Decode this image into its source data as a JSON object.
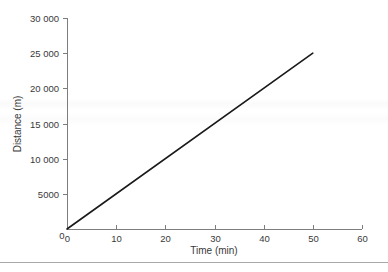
{
  "chart_data": {
    "type": "line",
    "title": "",
    "subtitle": "",
    "xlabel": "Time (min)",
    "ylabel": "Distance (m)",
    "xlim": [
      0,
      60
    ],
    "ylim": [
      0,
      30000
    ],
    "grid": false,
    "legend": null,
    "x_ticks": [
      0,
      10,
      20,
      30,
      40,
      50,
      60
    ],
    "x_tick_labels": [
      "0",
      "10",
      "20",
      "30",
      "40",
      "50",
      "60"
    ],
    "y_ticks": [
      0,
      5000,
      10000,
      15000,
      20000,
      25000,
      30000
    ],
    "y_tick_labels": [
      "0",
      "5000",
      "10 000",
      "15 000",
      "20 000",
      "25 000",
      "30 000"
    ],
    "origin_label": "0",
    "series": [
      {
        "name": "Distance",
        "color": "#1a1a1a",
        "x": [
          0,
          50
        ],
        "values": [
          0,
          25000
        ],
        "points": [
          {
            "x": 0,
            "y": 0
          },
          {
            "x": 10,
            "y": 5000
          },
          {
            "x": 20,
            "y": 10000
          },
          {
            "x": 30,
            "y": 15000
          },
          {
            "x": 40,
            "y": 20000
          },
          {
            "x": 50,
            "y": 25000
          }
        ],
        "slope_m_per_min": 500
      }
    ],
    "annotations": [],
    "colors": {
      "line": "#1a1a1a",
      "axis": "#7d7d7d",
      "text": "#3a3a3a",
      "background": "#ffffff",
      "rule": "#a9a9a9"
    }
  }
}
